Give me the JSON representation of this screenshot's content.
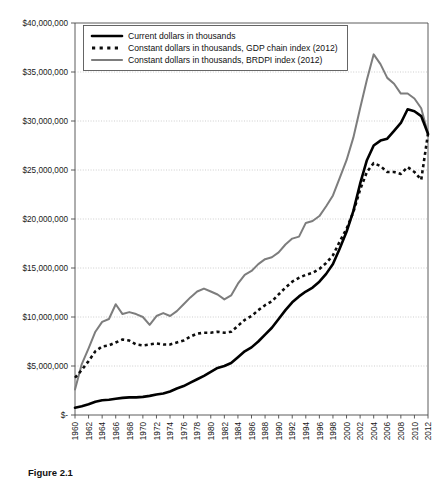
{
  "chart_data": {
    "type": "line",
    "title": "",
    "xlabel": "",
    "ylabel": "",
    "grid": true,
    "legend_position": "top-left-inside",
    "xlim": [
      1960,
      2012
    ],
    "ylim": [
      0,
      40000000
    ],
    "ytick_step": 5000000,
    "ytick_labels": [
      "$40,000,000",
      "$35,000,000",
      "$30,000,000",
      "$25,000,000",
      "$20,000,000",
      "$15,000,000",
      "$10,000,000",
      "$5,000,000",
      "$-"
    ],
    "ytick_values": [
      40000000,
      35000000,
      30000000,
      25000000,
      20000000,
      15000000,
      10000000,
      5000000,
      0
    ],
    "xtick_labels": [
      "1960",
      "1962",
      "1964",
      "1966",
      "1968",
      "1970",
      "1972",
      "1974",
      "1976",
      "1978",
      "1980",
      "1982",
      "1984",
      "1986",
      "1988",
      "1990",
      "1992",
      "1994",
      "1996",
      "1998",
      "2000",
      "2002",
      "2004",
      "2006",
      "2008",
      "2010",
      "2012"
    ],
    "xtick_values": [
      1960,
      1962,
      1964,
      1966,
      1968,
      1970,
      1972,
      1974,
      1976,
      1978,
      1980,
      1982,
      1984,
      1986,
      1988,
      1990,
      1992,
      1994,
      1996,
      1998,
      2000,
      2002,
      2004,
      2006,
      2008,
      2010,
      2012
    ],
    "x": [
      1960,
      1961,
      1962,
      1963,
      1964,
      1965,
      1966,
      1967,
      1968,
      1969,
      1970,
      1971,
      1972,
      1973,
      1974,
      1975,
      1976,
      1977,
      1978,
      1979,
      1980,
      1981,
      1982,
      1983,
      1984,
      1985,
      1986,
      1987,
      1988,
      1989,
      1990,
      1991,
      1992,
      1993,
      1994,
      1995,
      1996,
      1997,
      1998,
      1999,
      2000,
      2001,
      2002,
      2003,
      2004,
      2005,
      2006,
      2007,
      2008,
      2009,
      2010,
      2011,
      2012
    ],
    "series": [
      {
        "name": "Current dollars in thousands",
        "color": "#000000",
        "style": "solid",
        "values": [
          750000,
          900000,
          1100000,
          1350000,
          1500000,
          1550000,
          1650000,
          1750000,
          1800000,
          1800000,
          1850000,
          1950000,
          2100000,
          2200000,
          2400000,
          2700000,
          2950000,
          3300000,
          3650000,
          4000000,
          4400000,
          4800000,
          5000000,
          5300000,
          5900000,
          6500000,
          6900000,
          7500000,
          8200000,
          8900000,
          9800000,
          10700000,
          11500000,
          12100000,
          12600000,
          13000000,
          13600000,
          14400000,
          15400000,
          17000000,
          18700000,
          20800000,
          23600000,
          26000000,
          27500000,
          28000000,
          28200000,
          29000000,
          29800000,
          31200000,
          31000000,
          30500000,
          28700000
        ]
      },
      {
        "name": "Constant dollars in thousands, GDP chain index (2012)",
        "color": "#0d0d0d",
        "style": "dotted",
        "values": [
          3800000,
          4600000,
          5500000,
          6500000,
          7000000,
          7100000,
          7400000,
          7700000,
          7600000,
          7200000,
          7100000,
          7200000,
          7300000,
          7200000,
          7200000,
          7400000,
          7600000,
          8000000,
          8300000,
          8400000,
          8400000,
          8500000,
          8400000,
          8500000,
          9100000,
          9700000,
          10100000,
          10700000,
          11200000,
          11600000,
          12300000,
          13000000,
          13600000,
          14000000,
          14300000,
          14500000,
          14900000,
          15500000,
          16300000,
          17700000,
          19000000,
          20700000,
          23000000,
          24800000,
          25700000,
          25400000,
          24800000,
          24800000,
          24600000,
          25300000,
          24800000,
          24000000,
          28700000
        ]
      },
      {
        "name": "Constant dollars in thousands, BRDPI index (2012)",
        "color": "#7d7d7d",
        "style": "solid",
        "values": [
          2600000,
          5200000,
          6800000,
          8500000,
          9500000,
          9800000,
          11300000,
          10300000,
          10500000,
          10300000,
          10000000,
          9200000,
          10100000,
          10400000,
          10100000,
          10600000,
          11300000,
          12000000,
          12600000,
          12900000,
          12600000,
          12300000,
          11800000,
          12200000,
          13400000,
          14300000,
          14700000,
          15400000,
          15900000,
          16100000,
          16600000,
          17400000,
          18000000,
          18200000,
          19600000,
          19800000,
          20300000,
          21300000,
          22400000,
          24200000,
          26000000,
          28300000,
          31300000,
          34200000,
          36800000,
          35800000,
          34400000,
          33800000,
          32800000,
          32800000,
          32300000,
          31300000,
          28700000
        ]
      }
    ]
  },
  "legend": {
    "entries": [
      {
        "label": "Current dollars in thousands"
      },
      {
        "label": "Constant dollars in thousands, GDP chain index (2012)"
      },
      {
        "label": "Constant dollars in thousands, BRDPI index (2012)"
      }
    ]
  },
  "caption": {
    "text": "Figure 2.1"
  }
}
